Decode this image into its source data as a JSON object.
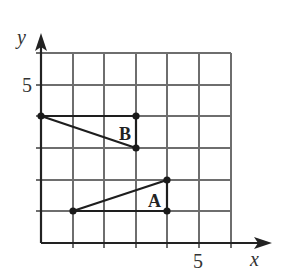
{
  "diagram": {
    "type": "coordinate-grid",
    "x_axis": {
      "label": "x",
      "tick_label": "5",
      "tick_value": 5,
      "range": [
        0,
        6
      ]
    },
    "y_axis": {
      "label": "y",
      "tick_label": "5",
      "tick_value": 5,
      "range": [
        0,
        6
      ]
    },
    "grid": {
      "step": 1,
      "columns": 6,
      "rows": 6
    },
    "shapes": [
      {
        "label": "B",
        "vertices": [
          [
            0,
            4
          ],
          [
            3,
            4
          ],
          [
            3,
            3
          ]
        ]
      },
      {
        "label": "A",
        "vertices": [
          [
            1,
            1
          ],
          [
            4,
            1
          ],
          [
            4,
            2
          ]
        ]
      }
    ],
    "colors": {
      "grid": "#6e6e6e",
      "axis": "#222222",
      "shape": "#1e1e1e"
    }
  }
}
